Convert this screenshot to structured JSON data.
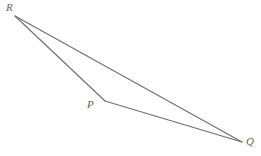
{
  "figure": {
    "name": "triangle-pqr",
    "type": "geometry-diagram",
    "background_color": "#ffffff",
    "stroke_color": "#6e6e6e",
    "stroke_width": 1.1,
    "label_color": "#5f5f5f",
    "canvas": {
      "width": 261,
      "height": 156
    },
    "vertices": [
      {
        "id": "R",
        "label": "R",
        "x": 15,
        "y": 16,
        "label_x": 6,
        "label_y": 2
      },
      {
        "id": "P",
        "label": "P",
        "x": 105,
        "y": 101,
        "label_x": 87,
        "label_y": 99
      },
      {
        "id": "Q",
        "label": "Q",
        "x": 242,
        "y": 142,
        "label_x": 246,
        "label_y": 136
      }
    ],
    "edges": [
      {
        "id": "RP",
        "from": "R",
        "to": "P",
        "path": "M 15 16 L 105 101"
      },
      {
        "id": "PQ",
        "from": "P",
        "to": "Q",
        "path": "M 105 101 L 242 142"
      },
      {
        "id": "RQ",
        "from": "R",
        "to": "Q",
        "path": "M 15 16 L 242 142"
      }
    ]
  }
}
